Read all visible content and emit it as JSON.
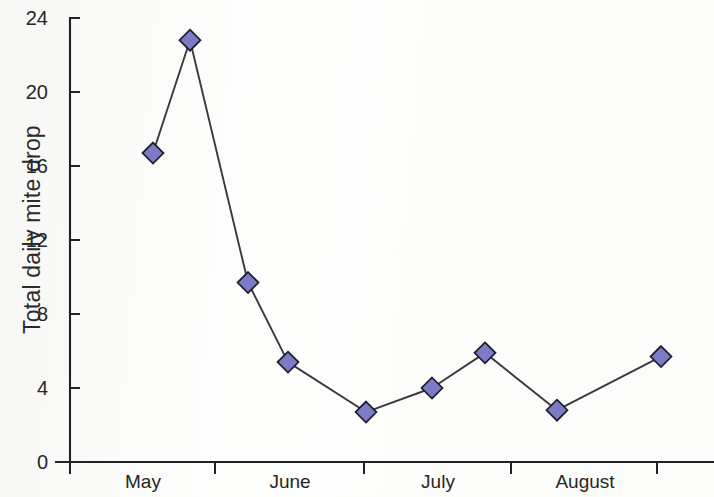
{
  "chart_data": {
    "type": "line",
    "title": "",
    "subtitle": "",
    "xlabel": "",
    "ylabel": "Total daily mite drop",
    "ylim": [
      0,
      24
    ],
    "ytick_values": [
      0,
      4,
      8,
      12,
      16,
      20,
      24
    ],
    "ytick_labels": [
      "0",
      "4",
      "8",
      "12",
      "16",
      "20",
      "24"
    ],
    "xtick_labels": [
      "May",
      "June",
      "July",
      "August"
    ],
    "xtick_positions_px": [
      70,
      215,
      364,
      511,
      657
    ],
    "grid": false,
    "legend": null,
    "series": [
      {
        "name": "Total daily mite drop",
        "marker": "diamond",
        "marker_color": "#7b7bc8",
        "marker_edge_color": "#1d1d28",
        "line_color": "#3a3a3a",
        "x_px": [
          153,
          190,
          248,
          288,
          366,
          432,
          485,
          557,
          661
        ],
        "values": [
          16.7,
          22.8,
          9.7,
          5.4,
          2.7,
          4.0,
          5.9,
          2.8,
          5.7
        ]
      }
    ],
    "axis_color": "#222222",
    "background_color": "#fdfdfc",
    "n_points": 9
  },
  "axes": {
    "origin_px": {
      "x": 70,
      "y": 462
    },
    "y_top_px": 18,
    "x_right_px": 714
  }
}
